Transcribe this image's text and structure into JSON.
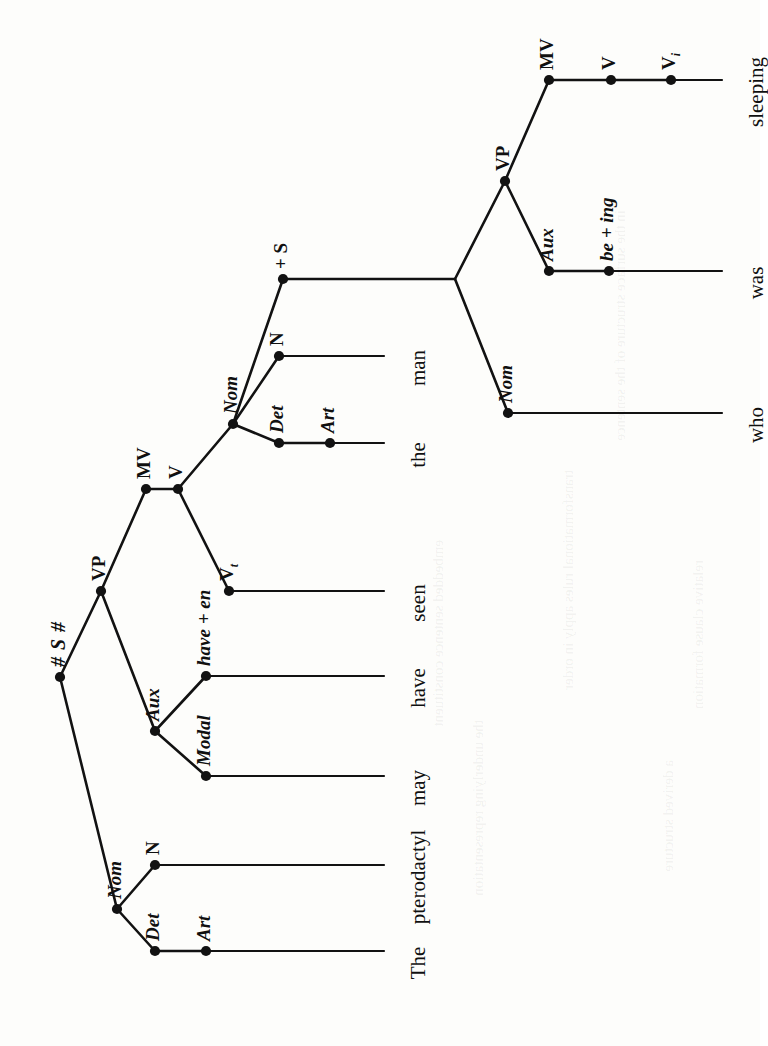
{
  "figure": {
    "name": "phrase-structure-tree",
    "orientation": "rotated-90-ccw",
    "background_color": "#fdfdfb",
    "ink_color": "#121212",
    "sentence": "The pterodactyl may have seen the man who was sleeping"
  },
  "tree": {
    "root_label": "# S #",
    "nodes": [
      {
        "id": "root",
        "label": "# S #",
        "style": "root",
        "x": 60,
        "y": 677,
        "dot": true
      },
      {
        "id": "nom1",
        "label": "Nom",
        "style": "cat",
        "x": 117,
        "y": 909,
        "dot": true
      },
      {
        "id": "det1",
        "label": "Det",
        "style": "cat",
        "x": 155,
        "y": 951,
        "dot": true
      },
      {
        "id": "art1",
        "label": "Art",
        "style": "cat",
        "x": 206,
        "y": 951,
        "dot": true
      },
      {
        "id": "n1",
        "label": "N",
        "style": "cat",
        "x": 155,
        "y": 865,
        "dot": true
      },
      {
        "id": "vp1",
        "label": "VP",
        "style": "cat",
        "x": 101,
        "y": 591,
        "dot": true
      },
      {
        "id": "aux1",
        "label": "Aux",
        "style": "cat",
        "x": 155,
        "y": 731,
        "dot": true
      },
      {
        "id": "modal",
        "label": "Modal",
        "style": "cat",
        "x": 206,
        "y": 776,
        "dot": true
      },
      {
        "id": "haveen",
        "label": "have + en",
        "style": "cat",
        "x": 206,
        "y": 676,
        "dot": true
      },
      {
        "id": "mv1",
        "label": "MV",
        "style": "cat",
        "x": 146,
        "y": 489,
        "dot": true
      },
      {
        "id": "v1",
        "label": "V",
        "style": "cat",
        "x": 178,
        "y": 489,
        "dot": true
      },
      {
        "id": "vt1",
        "label": "V",
        "sub": "t",
        "style": "cat",
        "x": 229,
        "y": 591,
        "dot": true
      },
      {
        "id": "nom2",
        "label": "Nom",
        "style": "cat",
        "x": 233,
        "y": 424,
        "dot": true
      },
      {
        "id": "det2",
        "label": "Det",
        "style": "cat",
        "x": 279,
        "y": 443,
        "dot": true
      },
      {
        "id": "art2",
        "label": "Art",
        "style": "cat",
        "x": 330,
        "y": 443,
        "dot": true
      },
      {
        "id": "n2",
        "label": "N",
        "style": "cat",
        "x": 279,
        "y": 356,
        "dot": true
      },
      {
        "id": "plusS",
        "label": "+ S",
        "style": "cat",
        "x": 283,
        "y": 279,
        "dot": true
      },
      {
        "id": "junction",
        "label": "",
        "style": "cat",
        "x": 455,
        "y": 279,
        "dot": false
      },
      {
        "id": "nom3",
        "label": "Nom",
        "style": "cat",
        "x": 508,
        "y": 413,
        "dot": true
      },
      {
        "id": "vp2",
        "label": "VP",
        "style": "cat",
        "x": 505,
        "y": 181,
        "dot": true
      },
      {
        "id": "aux2",
        "label": "Aux",
        "style": "cat",
        "x": 549,
        "y": 271,
        "dot": true
      },
      {
        "id": "being",
        "label": "be + ing",
        "style": "cat",
        "x": 609,
        "y": 271,
        "dot": true
      },
      {
        "id": "mv2",
        "label": "MV",
        "style": "cat",
        "x": 549,
        "y": 80,
        "dot": true
      },
      {
        "id": "v2",
        "label": "V",
        "style": "cat",
        "x": 611,
        "y": 80,
        "dot": true
      },
      {
        "id": "vi2",
        "label": "V",
        "sub": "i",
        "style": "cat",
        "x": 671,
        "y": 80,
        "dot": true
      }
    ],
    "edges": [
      {
        "from": "root",
        "to": "nom1"
      },
      {
        "from": "root",
        "to": "vp1"
      },
      {
        "from": "nom1",
        "to": "det1"
      },
      {
        "from": "nom1",
        "to": "n1"
      },
      {
        "from": "det1",
        "to": "art1"
      },
      {
        "from": "vp1",
        "to": "aux1"
      },
      {
        "from": "vp1",
        "to": "mv1"
      },
      {
        "from": "aux1",
        "to": "modal"
      },
      {
        "from": "aux1",
        "to": "haveen"
      },
      {
        "from": "mv1",
        "to": "v1"
      },
      {
        "from": "v1",
        "to": "vt1"
      },
      {
        "from": "v1",
        "to": "nom2"
      },
      {
        "from": "nom2",
        "to": "det2"
      },
      {
        "from": "nom2",
        "to": "n2"
      },
      {
        "from": "nom2",
        "to": "plusS"
      },
      {
        "from": "det2",
        "to": "art2"
      },
      {
        "from": "plusS",
        "to": "junction"
      },
      {
        "from": "junction",
        "to": "nom3"
      },
      {
        "from": "junction",
        "to": "vp2"
      },
      {
        "from": "vp2",
        "to": "aux2"
      },
      {
        "from": "vp2",
        "to": "mv2"
      },
      {
        "from": "aux2",
        "to": "being"
      },
      {
        "from": "mv2",
        "to": "v2"
      },
      {
        "from": "v2",
        "to": "vi2"
      }
    ],
    "terminals": [
      {
        "id": "t-the1",
        "label": "The",
        "from_node": "art1",
        "x": 384,
        "y": 951
      },
      {
        "id": "t-pterodactyl",
        "label": "pterodactyl",
        "from_node": "n1",
        "x": 384,
        "y": 865
      },
      {
        "id": "t-may",
        "label": "may",
        "from_node": "modal",
        "x": 384,
        "y": 776
      },
      {
        "id": "t-have",
        "label": "have",
        "from_node": "haveen",
        "x": 384,
        "y": 676
      },
      {
        "id": "t-seen",
        "label": "seen",
        "from_node": "vt1",
        "x": 384,
        "y": 591
      },
      {
        "id": "t-the2",
        "label": "the",
        "from_node": "art2",
        "x": 384,
        "y": 443
      },
      {
        "id": "t-man",
        "label": "man",
        "from_node": "n2",
        "x": 384,
        "y": 356
      },
      {
        "id": "t-who",
        "label": "who",
        "from_node": "nom3",
        "x": 722,
        "y": 413
      },
      {
        "id": "t-was",
        "label": "was",
        "from_node": "being",
        "x": 722,
        "y": 271
      },
      {
        "id": "t-sleeping",
        "label": "sleeping",
        "from_node": "vi2",
        "x": 722,
        "y": 80
      }
    ]
  },
  "bleed_through": [
    {
      "text": "in the surface structure of the sentence",
      "x": 612,
      "y": 210
    },
    {
      "text": "transformational rules apply in order",
      "x": 560,
      "y": 470
    },
    {
      "text": "the underlying representation",
      "x": 470,
      "y": 720
    },
    {
      "text": "embedded sentence constituent",
      "x": 430,
      "y": 540
    },
    {
      "text": "relative clause formation",
      "x": 690,
      "y": 560
    },
    {
      "text": "a derived structure",
      "x": 660,
      "y": 760
    }
  ]
}
